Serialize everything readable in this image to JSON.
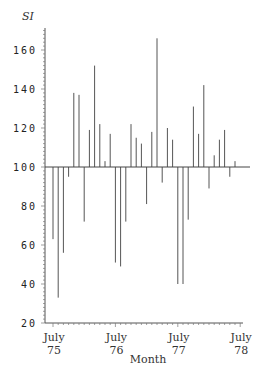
{
  "chart_data": {
    "type": "bar",
    "title": "",
    "xlabel": "Month",
    "ylabel": "SI",
    "ylim": [
      20,
      170
    ],
    "baseline": 100,
    "yticks": [
      20,
      40,
      60,
      80,
      100,
      120,
      140,
      160
    ],
    "xtick_labels": [
      {
        "month": "July",
        "year": "75"
      },
      {
        "month": "July",
        "year": "76"
      },
      {
        "month": "July",
        "year": "77"
      },
      {
        "month": "July",
        "year": "78"
      }
    ],
    "categories": [
      "Jul75",
      "Aug75",
      "Sep75",
      "Oct75",
      "Nov75",
      "Dec75",
      "Jan76",
      "Feb76",
      "Mar76",
      "Apr76",
      "May76",
      "Jun76",
      "Jul76",
      "Aug76",
      "Sep76",
      "Oct76",
      "Nov76",
      "Dec76",
      "Jan77",
      "Feb77",
      "Mar77",
      "Apr77",
      "May77",
      "Jun77",
      "Jul77",
      "Aug77",
      "Sep77",
      "Oct77",
      "Nov77",
      "Dec77",
      "Jan78",
      "Feb78",
      "Mar78",
      "Apr78",
      "May78",
      "Jun78"
    ],
    "values": [
      63,
      33,
      56,
      95,
      138,
      137,
      72,
      119,
      152,
      122,
      103,
      117,
      51,
      49,
      72,
      122,
      115,
      112,
      81,
      118,
      166,
      92,
      120,
      114,
      40,
      40,
      73,
      131,
      117,
      142,
      89,
      106,
      114,
      119,
      95,
      103
    ],
    "grid": false,
    "legend": null
  }
}
